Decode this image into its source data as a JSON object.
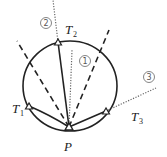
{
  "diagram": {
    "point_label": "P",
    "tangent_points": [
      {
        "name": "T",
        "sub": "1"
      },
      {
        "name": "T",
        "sub": "2"
      },
      {
        "name": "T",
        "sub": "3"
      }
    ],
    "line_labels": [
      "1",
      "2",
      "3"
    ],
    "colors": {
      "stroke": "#222222",
      "dotted": "#666666",
      "background": "#ffffff"
    }
  }
}
